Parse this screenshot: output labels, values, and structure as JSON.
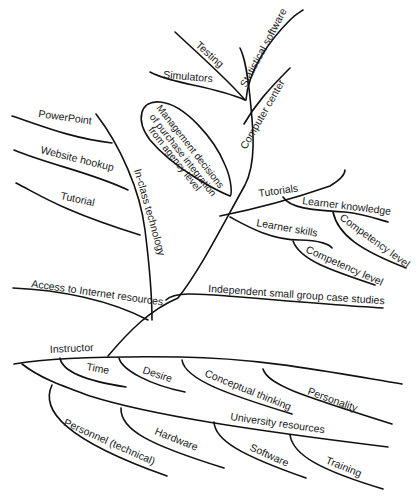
{
  "diagram": {
    "type": "fishbone-tree",
    "root_branch": "Instructor",
    "upper_tree": {
      "computer_center": {
        "label": "Computer center",
        "children": [
          "Testing",
          "Statistical software",
          "Simulators"
        ]
      },
      "management": {
        "line1": "Management decisions",
        "line2": "of purchase integration",
        "line3": "from agency level"
      },
      "in_class_technology": {
        "label": "In-class technology",
        "children": [
          "PowerPoint",
          "Website hookup",
          "Tutorial"
        ]
      },
      "tutorials": {
        "label": "Tutorials",
        "learner_knowledge": "Learner knowledge",
        "learner_knowledge_child": "Competency level",
        "learner_skills": "Learner skills",
        "learner_skills_child": "Competency level"
      },
      "access_internet": "Access to Internet resources",
      "independent_group": "Independent small group case studies"
    },
    "lower_tree": {
      "instructor": {
        "label": "Instructor",
        "children": [
          "Time",
          "Desire",
          "Conceptual thinking",
          "Personality"
        ]
      },
      "university_resources": {
        "label": "University resources",
        "children": [
          "Personnel (technical)",
          "Hardware",
          "Software",
          "Training"
        ]
      }
    }
  }
}
